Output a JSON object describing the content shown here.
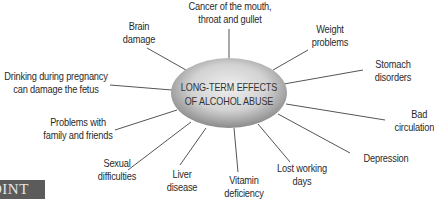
{
  "diagram": {
    "type": "spider",
    "center": {
      "lines": [
        "LONG-TERM EFFECTS",
        "OF ALCOHOL ABUSE"
      ],
      "shape": "ellipse",
      "cx": 229,
      "cy": 93,
      "rx": 58,
      "ry": 35,
      "gradient": {
        "inner": "#ececec",
        "outer": "#8a8a8a"
      }
    },
    "line_color": "#555555",
    "text_color": "#2a2a2a",
    "branches": [
      {
        "id": "cancer",
        "lines": [
          "Cancer of the mouth,",
          "throat and gullet"
        ],
        "x1": 229,
        "y1": 29,
        "x2": 229,
        "y2": 58
      },
      {
        "id": "weight",
        "lines": [
          "Weight",
          "problems"
        ],
        "x1": 308,
        "y1": 50,
        "x2": 273,
        "y2": 70
      },
      {
        "id": "stomach",
        "lines": [
          "Stomach",
          "disorders"
        ],
        "x1": 363,
        "y1": 70,
        "x2": 284,
        "y2": 84
      },
      {
        "id": "circulation",
        "lines": [
          "Bad",
          "circulation"
        ],
        "x1": 385,
        "y1": 120,
        "x2": 286,
        "y2": 104
      },
      {
        "id": "depression",
        "lines": [
          "Depression"
        ],
        "x1": 350,
        "y1": 153,
        "x2": 278,
        "y2": 114
      },
      {
        "id": "lost-working-days",
        "lines": [
          "Lost working",
          "days"
        ],
        "x1": 290,
        "y1": 162,
        "x2": 258,
        "y2": 124
      },
      {
        "id": "vitamin",
        "lines": [
          "Vitamin",
          "deficiency"
        ],
        "x1": 238,
        "y1": 172,
        "x2": 234,
        "y2": 128
      },
      {
        "id": "liver",
        "lines": [
          "Liver",
          "disease"
        ],
        "x1": 180,
        "y1": 165,
        "x2": 206,
        "y2": 128
      },
      {
        "id": "sexual",
        "lines": [
          "Sexual",
          "difficulties"
        ],
        "x1": 128,
        "y1": 170,
        "x2": 191,
        "y2": 122
      },
      {
        "id": "family",
        "lines": [
          "Problems with",
          "family and friends"
        ],
        "x1": 115,
        "y1": 130,
        "x2": 177,
        "y2": 110
      },
      {
        "id": "pregnancy",
        "lines": [
          "Drinking during pregnancy",
          "can damage the fetus"
        ],
        "x1": 110,
        "y1": 85,
        "x2": 172,
        "y2": 90
      },
      {
        "id": "brain",
        "lines": [
          "Brain",
          "damage"
        ],
        "x1": 147,
        "y1": 48,
        "x2": 186,
        "y2": 70
      }
    ]
  },
  "corner_badge": {
    "text": "OINT",
    "bg": "#5b5b5b",
    "fg": "#e6e6e6"
  }
}
